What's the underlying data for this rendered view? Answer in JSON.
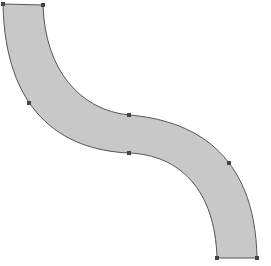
{
  "canvas": {
    "width": 271,
    "height": 266,
    "background": "#ffffff"
  },
  "shape": {
    "kind": "s-curve-band",
    "fill": "#c8c8c8",
    "stroke": "#555555",
    "handle_color": "#444444"
  },
  "handles": [
    {
      "name": "top-left",
      "x": 3,
      "y": 4
    },
    {
      "name": "top-right",
      "x": 43,
      "y": 5
    },
    {
      "name": "left-mid",
      "x": 29,
      "y": 103
    },
    {
      "name": "center-top",
      "x": 129,
      "y": 115
    },
    {
      "name": "center-bottom",
      "x": 129,
      "y": 153
    },
    {
      "name": "right-mid",
      "x": 229,
      "y": 163
    },
    {
      "name": "bottom-left",
      "x": 217,
      "y": 258
    },
    {
      "name": "bottom-right",
      "x": 257,
      "y": 258
    }
  ]
}
